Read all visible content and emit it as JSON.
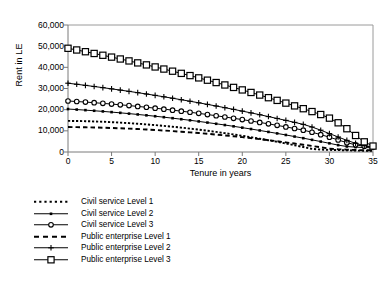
{
  "chart_data": {
    "type": "line",
    "title": "",
    "xlabel": "Tenure in years",
    "ylabel": "Rent in LE",
    "xlim": [
      0,
      35
    ],
    "ylim": [
      0,
      60000
    ],
    "xticks": [
      0,
      5,
      10,
      15,
      20,
      25,
      30,
      35
    ],
    "yticks": [
      0,
      10000,
      20000,
      30000,
      40000,
      50000,
      60000
    ],
    "ytick_labels": [
      "0",
      "10,000",
      "20,000",
      "30,000",
      "40,000",
      "50,000",
      "60,000"
    ],
    "xtick_labels": [
      "0",
      "5",
      "10",
      "15",
      "20",
      "25",
      "30",
      "35"
    ],
    "grid": false,
    "legend_position": "below-left",
    "x": [
      0,
      1,
      2,
      3,
      4,
      5,
      6,
      7,
      8,
      9,
      10,
      11,
      12,
      13,
      14,
      15,
      16,
      17,
      18,
      19,
      20,
      21,
      22,
      23,
      24,
      25,
      26,
      27,
      28,
      29,
      30,
      31,
      32,
      33,
      34,
      35
    ],
    "series": [
      {
        "name": "Civil service Level 1",
        "marker": "none",
        "dash": "dotted",
        "values": [
          14700,
          14650,
          14560,
          14440,
          14290,
          14100,
          13890,
          13640,
          13360,
          13050,
          12710,
          12340,
          11940,
          11510,
          11050,
          10560,
          10040,
          9490,
          8910,
          8300,
          7660,
          6990,
          6290,
          5560,
          4800,
          4010,
          3190,
          2340,
          1460,
          1150,
          1000,
          900,
          800,
          700,
          600,
          500
        ]
      },
      {
        "name": "Civil service Level 2",
        "marker": "small-square",
        "dash": "solid",
        "values": [
          20300,
          20050,
          19780,
          19490,
          19180,
          18850,
          18500,
          18130,
          17740,
          17330,
          16900,
          16450,
          15980,
          15490,
          14980,
          14450,
          13900,
          13330,
          12740,
          12130,
          11500,
          10850,
          10180,
          9490,
          8780,
          8050,
          7300,
          6530,
          5740,
          4930,
          4100,
          3250,
          2600,
          2300,
          2100,
          2000
        ]
      },
      {
        "name": "Civil service Level 3",
        "marker": "circle",
        "dash": "solid",
        "values": [
          24100,
          23850,
          23580,
          23290,
          22980,
          22650,
          22300,
          21930,
          21540,
          21130,
          20700,
          20250,
          19780,
          19290,
          18780,
          18250,
          17700,
          17130,
          16540,
          15930,
          15300,
          14650,
          13980,
          13290,
          12580,
          11850,
          11100,
          10330,
          9340,
          8200,
          7000,
          5700,
          4400,
          3400,
          2700,
          2350
        ]
      },
      {
        "name": "Public enterprise Level 1",
        "marker": "none",
        "dash": "dashed",
        "values": [
          11800,
          11750,
          11680,
          11590,
          11480,
          11350,
          11200,
          11030,
          10840,
          10630,
          10400,
          10150,
          9880,
          9590,
          9280,
          8950,
          8600,
          8230,
          7840,
          7430,
          7000,
          6550,
          6080,
          5590,
          5080,
          4550,
          4000,
          3430,
          2840,
          2230,
          1600,
          1300,
          1100,
          950,
          850,
          800
        ]
      },
      {
        "name": "Public enterprise Level 2",
        "marker": "plus",
        "dash": "solid",
        "values": [
          32500,
          32000,
          31480,
          30950,
          30400,
          29830,
          29250,
          28650,
          28030,
          27400,
          26750,
          26080,
          25400,
          24700,
          23980,
          23250,
          22500,
          21730,
          20940,
          20140,
          19320,
          18480,
          17620,
          16740,
          15840,
          14930,
          14000,
          13050,
          11800,
          10300,
          8700,
          7100,
          5500,
          4100,
          3000,
          2400
        ]
      },
      {
        "name": "Public enterprise Level 3",
        "marker": "large-square",
        "dash": "solid",
        "values": [
          49000,
          48200,
          47380,
          46550,
          45700,
          44830,
          43940,
          43030,
          42100,
          41150,
          40180,
          39190,
          38180,
          37150,
          36100,
          35020,
          33930,
          32810,
          31670,
          30510,
          29330,
          28130,
          26900,
          25660,
          24390,
          23100,
          21790,
          20460,
          19100,
          17700,
          16000,
          13800,
          11000,
          7800,
          4800,
          2800
        ]
      }
    ]
  },
  "legend": {
    "items": [
      {
        "label": "Civil service Level 1",
        "key": "dotted-line-key"
      },
      {
        "label": "Civil service Level 2",
        "key": "small-square-line-key"
      },
      {
        "label": "Civil service Level 3",
        "key": "circle-line-key"
      },
      {
        "label": "Public enterprise Level 1",
        "key": "dashed-line-key"
      },
      {
        "label": "Public enterprise Level 2",
        "key": "plus-line-key"
      },
      {
        "label": "Public enterprise Level 3",
        "key": "large-square-line-key"
      }
    ]
  },
  "colors": {
    "line": "#000000",
    "frame": "#9a9a9a",
    "axis": "#7a7a7a",
    "background": "#ffffff"
  }
}
